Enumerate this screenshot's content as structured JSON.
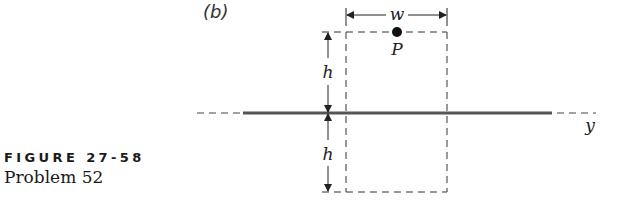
{
  "figure": {
    "panel_label": "(b)",
    "caption_title": "FIGURE 27-58",
    "caption_subtitle": "Problem 52"
  },
  "diagram": {
    "labels": {
      "width": "w",
      "height_top": "h",
      "height_bottom": "h",
      "point": "P",
      "axis": "y"
    },
    "colors": {
      "line": "#222222",
      "conductor": "#555555",
      "dashed": "#333333"
    }
  }
}
